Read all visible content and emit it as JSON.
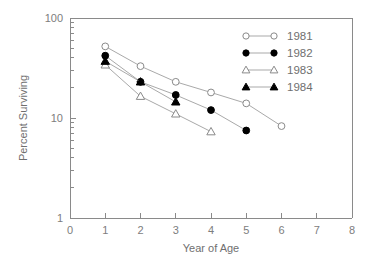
{
  "chart_data": {
    "type": "line",
    "title": "",
    "xlabel": "Year of Age",
    "ylabel": "Percent Surviving",
    "xlim": [
      0,
      8
    ],
    "ylim": [
      1,
      100
    ],
    "yscale": "log",
    "xscale": "linear",
    "grid": false,
    "legend_position": "upper-right",
    "xticks": [
      "0",
      "1",
      "2",
      "3",
      "4",
      "5",
      "6",
      "7",
      "8"
    ],
    "xtick_values": [
      0,
      1,
      2,
      3,
      4,
      5,
      6,
      7,
      8
    ],
    "yticks": [
      "1",
      "10",
      "100"
    ],
    "ytick_values": [
      1,
      10,
      100
    ],
    "yminor_values": [
      2,
      3,
      4,
      5,
      6,
      7,
      8,
      9,
      20,
      30,
      40,
      50,
      60,
      70,
      80,
      90
    ],
    "series": [
      {
        "name": "1981",
        "marker": "open-circle",
        "x": [
          1,
          2,
          3,
          4,
          5,
          6
        ],
        "values": [
          52,
          33,
          23,
          18,
          14,
          8.3
        ]
      },
      {
        "name": "1982",
        "marker": "filled-circle",
        "x": [
          1,
          2,
          3,
          4,
          5
        ],
        "values": [
          42,
          23,
          17,
          12,
          7.5
        ]
      },
      {
        "name": "1983",
        "marker": "open-triangle",
        "x": [
          1,
          2,
          3,
          4
        ],
        "values": [
          34,
          16.5,
          11,
          7.3
        ]
      },
      {
        "name": "1984",
        "marker": "filled-triangle",
        "x": [
          1,
          2,
          3
        ],
        "values": [
          37,
          23,
          14.5
        ]
      }
    ]
  },
  "legend": {
    "entries": [
      {
        "label": "1981",
        "marker": "open-circle"
      },
      {
        "label": "1982",
        "marker": "filled-circle"
      },
      {
        "label": "1983",
        "marker": "open-triangle"
      },
      {
        "label": "1984",
        "marker": "filled-triangle"
      }
    ]
  },
  "colors": {
    "axis": "#8a8a8a",
    "line": "#a9a9a9",
    "text": "#6f6f6f",
    "marker_fill_open": "#ffffff",
    "marker_fill_solid": "#000000",
    "background": "#ffffff"
  }
}
